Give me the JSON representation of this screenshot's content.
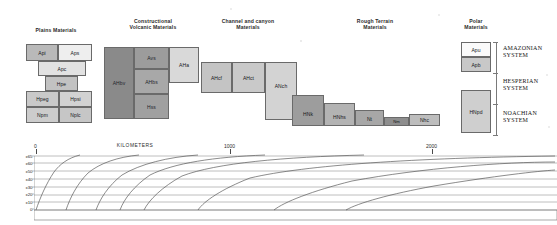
{
  "figure": {
    "background": "#ffffff"
  },
  "columns": [
    {
      "id": "plains",
      "label": "Plains Materials",
      "x": 55,
      "y": 27
    },
    {
      "id": "volcanic",
      "label": "Constructional\nVolcanic Materials",
      "x": 152,
      "y": 18
    },
    {
      "id": "channel",
      "label": "Channel and canyon\nMaterials",
      "x": 245,
      "y": 18
    },
    {
      "id": "rough",
      "label": "Rough Terrain\nMaterials",
      "x": 370,
      "y": 18
    },
    {
      "id": "polar",
      "label": "Polar\nMaterials",
      "x": 482,
      "y": 18
    }
  ],
  "units": [
    {
      "col": "plains",
      "label": "Api",
      "x": 26,
      "y": 44,
      "w": 32,
      "h": 17,
      "fill": "#b9b9b9",
      "align": "center"
    },
    {
      "col": "plains",
      "label": "Aps",
      "x": 58,
      "y": 44,
      "w": 34,
      "h": 17,
      "fill": "#eeeeee",
      "align": "center"
    },
    {
      "col": "plains",
      "label": "Apc",
      "x": 38,
      "y": 61,
      "w": 48,
      "h": 15,
      "fill": "#e2e2e2",
      "align": "center"
    },
    {
      "col": "plains",
      "label": "Hpe",
      "x": 45,
      "y": 76,
      "w": 33,
      "h": 15,
      "fill": "#c2c2c2",
      "align": "center"
    },
    {
      "col": "plains",
      "label": "Hpeg",
      "x": 26,
      "y": 91,
      "w": 33,
      "h": 16,
      "fill": "#c9c9c9",
      "align": "center"
    },
    {
      "col": "plains",
      "label": "Hpsi",
      "x": 59,
      "y": 91,
      "w": 33,
      "h": 16,
      "fill": "#d2d2d2",
      "align": "center"
    },
    {
      "col": "plains",
      "label": "Npm",
      "x": 26,
      "y": 107,
      "w": 33,
      "h": 16,
      "fill": "#cccccc",
      "align": "center"
    },
    {
      "col": "plains",
      "label": "Nplc",
      "x": 59,
      "y": 107,
      "w": 33,
      "h": 16,
      "fill": "#c6c6c6",
      "align": "center"
    },
    {
      "col": "volcanic",
      "label": "AHbv",
      "x": 104,
      "y": 47,
      "w": 30,
      "h": 72,
      "fill": "#8a8a8a",
      "align": "center"
    },
    {
      "col": "volcanic",
      "label": "Avs",
      "x": 134,
      "y": 47,
      "w": 35,
      "h": 22,
      "fill": "#9c9c9c",
      "align": "center"
    },
    {
      "col": "volcanic",
      "label": "AHbs",
      "x": 134,
      "y": 69,
      "w": 35,
      "h": 25,
      "fill": "#a8a8a8",
      "align": "center"
    },
    {
      "col": "volcanic",
      "label": "Hss",
      "x": 134,
      "y": 94,
      "w": 35,
      "h": 25,
      "fill": "#a0a0a0",
      "align": "center"
    },
    {
      "col": "volcanic",
      "label": "AHa",
      "x": 169,
      "y": 47,
      "w": 30,
      "h": 36,
      "fill": "#d9d9d9",
      "align": "center"
    },
    {
      "col": "channel",
      "label": "AHcf",
      "x": 201,
      "y": 62,
      "w": 31,
      "h": 31,
      "fill": "#c4c4c4",
      "align": "center"
    },
    {
      "col": "channel",
      "label": "AHct",
      "x": 232,
      "y": 62,
      "w": 33,
      "h": 31,
      "fill": "#c9c9c9",
      "align": "center"
    },
    {
      "col": "channel",
      "label": "ANch",
      "x": 265,
      "y": 62,
      "w": 32,
      "h": 58,
      "fill": "#d3d3d3",
      "align": "center"
    },
    {
      "col": "rough",
      "label": "HNk",
      "x": 292,
      "y": 95,
      "w": 32,
      "h": 31,
      "fill": "#9d9d9d",
      "align": "center"
    },
    {
      "col": "rough",
      "label": "HNhs",
      "x": 324,
      "y": 103,
      "w": 31,
      "h": 23,
      "fill": "#b3b3b3",
      "align": "center"
    },
    {
      "col": "rough",
      "label": "Nt",
      "x": 355,
      "y": 110,
      "w": 29,
      "h": 16,
      "fill": "#a7a7a7",
      "align": "center"
    },
    {
      "col": "rough",
      "label": "Nm",
      "x": 384,
      "y": 117,
      "w": 25,
      "h": 9,
      "fill": "#8e8e8e",
      "align": "center"
    },
    {
      "col": "rough",
      "label": "Nhc",
      "x": 409,
      "y": 114,
      "w": 31,
      "h": 12,
      "fill": "#bdbdbd",
      "align": "center"
    },
    {
      "col": "polar",
      "label": "Apu",
      "x": 461,
      "y": 42,
      "w": 30,
      "h": 15,
      "fill": "#fafafa",
      "align": "center"
    },
    {
      "col": "polar",
      "label": "Apb",
      "x": 461,
      "y": 57,
      "w": 30,
      "h": 15,
      "fill": "#c8c8c8",
      "align": "center"
    },
    {
      "col": "polar",
      "label": "HNpd",
      "x": 461,
      "y": 90,
      "w": 30,
      "h": 43,
      "fill": "#cfcfcf",
      "align": "center"
    }
  ],
  "systems": [
    {
      "label": "AMAZONIAN\nSYSTEM",
      "x": 503,
      "y": 45,
      "bracket_top": 42,
      "bracket_bottom": 73
    },
    {
      "label": "HESPERIAN\nSYSTEM",
      "x": 503,
      "y": 78,
      "bracket_top": 73,
      "bracket_bottom": 104
    },
    {
      "label": "NOACHIAN\nSYSTEM",
      "x": 503,
      "y": 110,
      "bracket_top": 104,
      "bracket_bottom": 135
    }
  ],
  "scale": {
    "title": "KILOMETERS",
    "ticks": [
      {
        "value": "0",
        "x": 35
      },
      {
        "value": "1000",
        "x": 230
      },
      {
        "value": "2000",
        "x": 432
      }
    ],
    "title_x": 132
  },
  "graph": {
    "latitude_labels": [
      "±65°",
      "±60°",
      "±50°",
      "±40°",
      "±30°",
      "±20°",
      "±10°",
      "0°"
    ],
    "latitude_y": [
      157,
      164,
      172,
      180,
      188,
      196,
      203,
      211
    ],
    "xlabel": "KILOMETERS",
    "curve_start_x": [
      38,
      68,
      98,
      120,
      142,
      196,
      270,
      340
    ],
    "line_color": "#555555",
    "grid_color": "#777777"
  }
}
